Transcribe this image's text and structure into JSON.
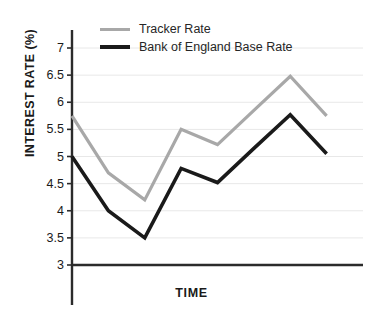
{
  "chart_data": {
    "type": "line",
    "title": "",
    "xlabel": "TIME",
    "ylabel": "INTEREST RATE (%)",
    "ylim": [
      3,
      7.4
    ],
    "yticks": [
      3,
      3.5,
      4,
      4.5,
      5,
      5.5,
      6,
      6.5,
      7
    ],
    "ytick_labels": [
      "3",
      "3.5",
      "4",
      "4.5",
      "5",
      "5.5",
      "6",
      "6.5",
      "7"
    ],
    "x": [
      0,
      1,
      2,
      3,
      4,
      5,
      6,
      7,
      8
    ],
    "xtick_labels": [],
    "grid": "horizontal",
    "legend_position": "top-left-inside",
    "series": [
      {
        "name": "Tracker Rate",
        "color": "#a8a8a8",
        "values": [
          5.75,
          4.7,
          4.2,
          5.5,
          5.22,
          5.85,
          6.48,
          5.75,
          null
        ]
      },
      {
        "name": "Bank of England Base Rate",
        "color": "#1a1a1a",
        "values": [
          5.0,
          4.0,
          3.5,
          4.78,
          4.52,
          5.15,
          5.77,
          5.05,
          null
        ]
      }
    ],
    "axis_color": "#2b2b2b",
    "grid_color": "#e8e8e8",
    "background": "#ffffff"
  },
  "legend": {
    "items": [
      {
        "label": "Tracker Rate",
        "swatch": "line-swatch-grey"
      },
      {
        "label": "Bank of England Base Rate",
        "swatch": "line-swatch-black"
      }
    ]
  },
  "axes": {
    "y_title": "INTEREST RATE (%)",
    "x_title": "TIME",
    "y_tick_labels": [
      "7",
      "6.5",
      "6",
      "5.5",
      "5",
      "4.5",
      "4",
      "3.5",
      "3"
    ]
  }
}
